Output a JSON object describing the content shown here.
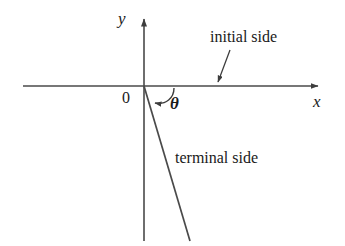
{
  "figure": {
    "kind": "angle-in-standard-position-diagram",
    "background_color": "#ffffff",
    "stroke_color": "#4a4a4a",
    "text_color": "#1a1a1a",
    "width": 345,
    "height": 246
  },
  "axes": {
    "y_label": "y",
    "x_label": "x",
    "origin_label": "0",
    "x_axis": {
      "x1": 23,
      "y1": 86,
      "x2": 322,
      "y2": 86,
      "arrow": "right"
    },
    "y_axis": {
      "x1": 144,
      "y1": 240,
      "x2": 144,
      "y2": 15,
      "arrow": "up"
    }
  },
  "angle": {
    "symbol": "θ",
    "arc_start": {
      "x": 173,
      "y": 87
    },
    "arc_end": {
      "x": 153,
      "y": 103
    },
    "arc_direction": "clockwise-from-positive-x-axis-downward"
  },
  "rays": {
    "initial_side": {
      "label": "initial side",
      "from": {
        "x": 144,
        "y": 86
      },
      "to": {
        "x": 322,
        "y": 86
      }
    },
    "terminal_side": {
      "label": "terminal side",
      "from": {
        "x": 144,
        "y": 86
      },
      "to": {
        "x": 190,
        "y": 241
      }
    }
  },
  "annotations": {
    "initial_side_pointer": {
      "name": "initial-side-arrow",
      "from": {
        "x": 229,
        "y": 51
      },
      "to": {
        "x": 217,
        "y": 84
      }
    }
  }
}
